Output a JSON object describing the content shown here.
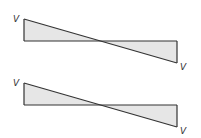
{
  "diagrams": [
    {
      "name": "shear-diagram-1",
      "left_label": "V",
      "right_label": "V",
      "left_value": 1,
      "right_value": -1
    },
    {
      "name": "shear-diagram-2",
      "left_label": "V",
      "right_label": "V",
      "left_value": 1,
      "right_value": -1
    }
  ],
  "colors": {
    "line": "#333333",
    "fill": "#e6e6e6"
  }
}
